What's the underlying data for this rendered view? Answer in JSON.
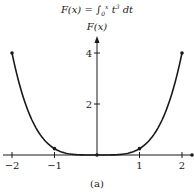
{
  "chart_data": {
    "type": "line",
    "title_parts": {
      "lhs": "F(x) = ",
      "integral": "∫",
      "upper": "x",
      "lower": "0",
      "integrand": "t",
      "power": "3",
      "diff": " dt"
    },
    "xlabel": "",
    "ylabel": "F(x)",
    "caption": "(a)",
    "xlim": [
      -2,
      2
    ],
    "ylim": [
      0,
      4
    ],
    "x_ticks": [
      -2,
      -1,
      1,
      2
    ],
    "x_tick_labels": [
      "−2",
      "−1",
      "1",
      "2"
    ],
    "y_ticks": [
      2,
      4
    ],
    "y_tick_labels": [
      "2",
      "4"
    ],
    "grid": false,
    "series": [
      {
        "name": "F(x) = x^4/4",
        "x": [
          -2,
          -1.5,
          -1,
          -0.5,
          0,
          0.5,
          1,
          1.5,
          2
        ],
        "values": [
          4,
          1.27,
          0.25,
          0.016,
          0,
          0.016,
          0.25,
          1.27,
          4
        ],
        "color": "#1a1a1a"
      }
    ],
    "marked_points": [
      {
        "x": -2,
        "y": 4
      },
      {
        "x": -1,
        "y": 0.25
      },
      {
        "x": 0,
        "y": 0
      },
      {
        "x": 1,
        "y": 0.25
      },
      {
        "x": 2,
        "y": 4
      }
    ]
  },
  "axis_color": "#1a1a1a"
}
